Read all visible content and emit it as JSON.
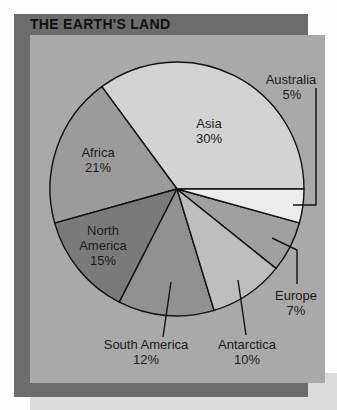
{
  "title": "THE EARTH'S LAND",
  "colors": {
    "frame": "#6c6c6c",
    "panel": "#a9a9a9",
    "shadow": "#dcdcdc",
    "background": "#fdfdfd"
  },
  "chart_data": {
    "type": "pie",
    "title": "THE EARTH'S LAND",
    "categories": [
      "Asia",
      "Africa",
      "North America",
      "South America",
      "Antarctica",
      "Europe",
      "Australia"
    ],
    "values": [
      30,
      21,
      15,
      12,
      10,
      7,
      5
    ],
    "unit": "%",
    "labels": [
      "Asia 30%",
      "Africa 21%",
      "North America 15%",
      "South America 12%",
      "Antarctica 10%",
      "Europe 7%",
      "Australia 5%"
    ],
    "legend": "none (direct labels with leader lines)"
  },
  "slices": [
    {
      "name": "Asia",
      "pct": "30%",
      "start": 233.7,
      "end": 360,
      "color": "#d3d3d3"
    },
    {
      "name": "Africa",
      "pct": "21%",
      "start": 164.4,
      "end": 233.7,
      "color": "#9b9b9b"
    },
    {
      "name": "North America",
      "pct": "15%",
      "start": 117,
      "end": 164.4,
      "color": "#7a7a7a"
    },
    {
      "name": "South America",
      "pct": "12%",
      "start": 73,
      "end": 117,
      "color": "#919191"
    },
    {
      "name": "Antarctica",
      "pct": "10%",
      "start": 38.7,
      "end": 73,
      "color": "#bebebe"
    },
    {
      "name": "Europe",
      "pct": "7%",
      "start": 15.5,
      "end": 38.7,
      "color": "#a0a0a0"
    },
    {
      "name": "Australia",
      "pct": "5%",
      "start": 0,
      "end": 15.5,
      "color": "#ececec"
    }
  ],
  "labels": {
    "asia": {
      "name": "Asia",
      "pct": "30%"
    },
    "africa": {
      "name": "Africa",
      "pct": "21%"
    },
    "north_america": {
      "line1": "North",
      "line2": "America",
      "pct": "15%"
    },
    "south_america": {
      "name": "South America",
      "pct": "12%"
    },
    "antarctica": {
      "name": "Antarctica",
      "pct": "10%"
    },
    "europe": {
      "name": "Europe",
      "pct": "7%"
    },
    "australia": {
      "name": "Australia",
      "pct": "5%"
    }
  }
}
